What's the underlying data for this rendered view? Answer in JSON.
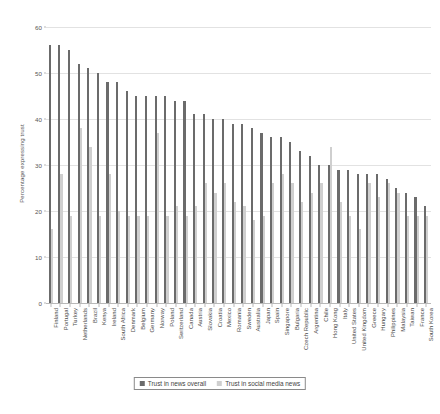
{
  "chart_data": {
    "type": "bar",
    "title": "",
    "subtitle": "",
    "xlabel": "",
    "ylabel": "Percentage expressing trust",
    "ylim": [
      0,
      60
    ],
    "yticks": [
      0,
      10,
      20,
      30,
      40,
      50,
      60
    ],
    "grid": true,
    "legend_position": "bottom",
    "categories": [
      "Finland",
      "Portugal",
      "Turkey",
      "Netherlands",
      "Brazil",
      "Kenya",
      "Ireland",
      "South Africa",
      "Denmark",
      "Belgium",
      "Germany",
      "Norway",
      "Poland",
      "Switzerland",
      "Canada",
      "Austria",
      "Slovakia",
      "Croatia",
      "Mexico",
      "Romania",
      "Sweden",
      "Australia",
      "Japan",
      "Spain",
      "Singapore",
      "Bulgaria",
      "Czech Republic",
      "Argentina",
      "Chile",
      "Hong Kong",
      "Italy",
      "United States",
      "United Kingdom",
      "Greece",
      "Hungary",
      "Philippines",
      "Malaysia",
      "Taiwan",
      "France",
      "South Korea"
    ],
    "series": [
      {
        "name": "Trust in news overall",
        "color": "#6b6b6b",
        "values": [
          56,
          56,
          55,
          52,
          51,
          50,
          48,
          48,
          46,
          45,
          45,
          45,
          45,
          44,
          44,
          41,
          41,
          40,
          40,
          39,
          39,
          38,
          37,
          36,
          36,
          35,
          33,
          32,
          30,
          30,
          29,
          29,
          28,
          28,
          28,
          27,
          25,
          24,
          23,
          21
        ]
      },
      {
        "name": "Trust in social media news",
        "color": "#cfcfcf",
        "values": [
          16,
          28,
          19,
          38,
          34,
          19,
          28,
          20,
          19,
          19,
          19,
          37,
          19,
          21,
          19,
          21,
          26,
          24,
          26,
          22,
          21,
          18,
          19,
          26,
          28,
          26,
          22,
          24,
          26,
          34,
          22,
          19,
          16,
          26,
          23,
          26,
          24,
          19,
          19,
          19
        ]
      }
    ]
  },
  "legend": {
    "items": [
      {
        "label": "Trust in news overall"
      },
      {
        "label": "Trust in social media news"
      }
    ]
  },
  "axis": {
    "y_title": "Percentage expressing trust",
    "y_tick_labels": [
      "0",
      "10",
      "20",
      "30",
      "40",
      "50",
      "60"
    ]
  }
}
